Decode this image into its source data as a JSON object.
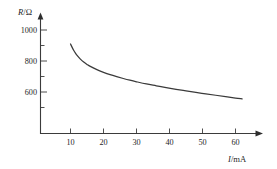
{
  "figure": {
    "background_color": "#ffffff",
    "axis_color": "#3b3b3b",
    "curve_color": "#3a3a3a"
  },
  "chart_data": {
    "type": "line",
    "title": "",
    "subtitle": "",
    "xlabel": "I/mA",
    "ylabel": "R/Ω",
    "xlabel_symbol": "I",
    "xlabel_unit": "/mA",
    "ylabel_symbol": "R",
    "ylabel_unit": "/Ω",
    "grid": false,
    "legend": null,
    "xlim": [
      0,
      67
    ],
    "ylim": [
      420,
      1075
    ],
    "xticks": [
      10,
      20,
      30,
      40,
      50,
      60
    ],
    "xtick_labels": [
      "10",
      "20",
      "30",
      "40",
      "50",
      "60"
    ],
    "xminor_ticks": [],
    "yticks": [
      600,
      800,
      1000
    ],
    "ytick_labels": [
      "600",
      "800",
      "1000"
    ],
    "yminor_ticks": [
      500,
      700,
      900
    ],
    "x_axis_arrow": true,
    "y_axis_arrow": true,
    "series": [
      {
        "name": "R vs I",
        "x": [
          10.0,
          10.5,
          11.0,
          11.5,
          12.0,
          13.0,
          14.0,
          15.0,
          16.0,
          18.0,
          20.0,
          22.0,
          24.0,
          26.0,
          28.0,
          30.0,
          33.0,
          36.0,
          39.0,
          42.0,
          45.0,
          48.0,
          51.0,
          54.0,
          57.0,
          60.0,
          62.0
        ],
        "y": [
          910,
          888,
          868,
          851,
          836,
          812,
          793,
          778,
          765,
          744,
          727,
          712,
          699,
          687,
          676,
          666,
          652,
          640,
          628,
          617,
          607,
          597,
          588,
          579,
          570,
          561,
          556
        ]
      }
    ]
  }
}
